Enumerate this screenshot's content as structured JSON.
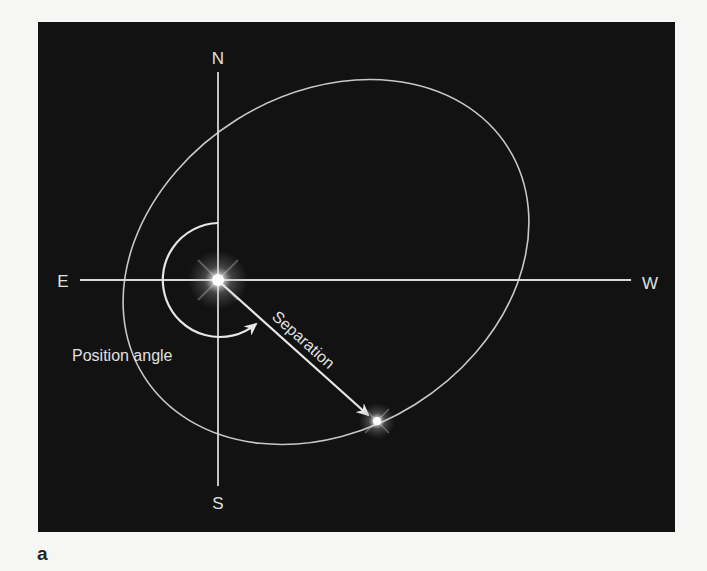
{
  "figure": {
    "panel_label": "a",
    "background_color": "#121212",
    "line_color": "#d8d8d8",
    "page_background": "#f6f6f4"
  },
  "compass": {
    "north": "N",
    "south": "S",
    "east": "E",
    "west": "W"
  },
  "annotations": {
    "position_angle": "Position angle",
    "separation": "Separation"
  },
  "stars": [
    {
      "name": "primary",
      "x": 218,
      "y": 280
    },
    {
      "name": "companion",
      "x": 377,
      "y": 421
    }
  ],
  "orbit": {
    "shape": "ellipse",
    "cx": 326,
    "cy": 262,
    "rx": 215,
    "ry": 168,
    "rotation_deg": -32
  }
}
